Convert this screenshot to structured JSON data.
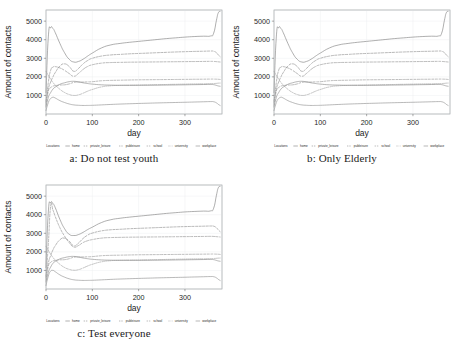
{
  "figure": {
    "panels": [
      {
        "id": "a",
        "caption": "a: Do not test youth"
      },
      {
        "id": "b",
        "caption": "b: Only Elderly"
      },
      {
        "id": "c",
        "caption": "c: Test everyone"
      }
    ]
  },
  "legend": {
    "title": "Locations",
    "entries": [
      {
        "label": "home",
        "color": "#7d7d7d",
        "dash": "none"
      },
      {
        "label": "private_leisure",
        "color": "#8a8a8a",
        "dash": "dashed"
      },
      {
        "label": "publeisure",
        "color": "#8f8f8f",
        "dash": "dashed"
      },
      {
        "label": "school",
        "color": "#949494",
        "dash": "dashed"
      },
      {
        "label": "university",
        "color": "#9a9a9a",
        "dash": "dotted"
      },
      {
        "label": "workplace",
        "color": "#878787",
        "dash": "none"
      }
    ]
  },
  "chart_data": [
    {
      "type": "line",
      "title": "a: Do not test youth",
      "xlabel": "day",
      "ylabel": "Amount of contacts",
      "xlim": [
        0,
        380
      ],
      "ylim": [
        0,
        5600
      ],
      "xticks": [
        0,
        100,
        200,
        300
      ],
      "yticks": [
        1000,
        2000,
        3000,
        4000,
        5000
      ],
      "grid": true,
      "legend_position": "bottom",
      "x": [
        0,
        5,
        10,
        15,
        20,
        30,
        40,
        50,
        60,
        70,
        80,
        90,
        100,
        120,
        140,
        160,
        180,
        200,
        220,
        240,
        260,
        280,
        300,
        320,
        340,
        355,
        362,
        368,
        372,
        376
      ],
      "series": [
        {
          "name": "home",
          "style": "solid",
          "values": [
            1150,
            4150,
            4650,
            4600,
            4380,
            3800,
            3300,
            2950,
            2800,
            2830,
            2950,
            3120,
            3280,
            3560,
            3720,
            3800,
            3860,
            3910,
            3960,
            4010,
            4060,
            4100,
            4140,
            4170,
            4190,
            4200,
            4350,
            5050,
            5450,
            5520
          ]
        },
        {
          "name": "private_leisure",
          "style": "dashed",
          "values": [
            700,
            1350,
            1720,
            2000,
            2230,
            2580,
            2700,
            2560,
            2300,
            2450,
            2700,
            2880,
            3000,
            3120,
            3180,
            3210,
            3240,
            3260,
            3280,
            3300,
            3320,
            3340,
            3355,
            3370,
            3380,
            3390,
            3380,
            3300,
            3180,
            3090
          ]
        },
        {
          "name": "publeisure",
          "style": "dashed",
          "values": [
            600,
            1700,
            2350,
            2520,
            2550,
            2480,
            2350,
            2180,
            2030,
            2180,
            2400,
            2560,
            2650,
            2740,
            2770,
            2780,
            2790,
            2795,
            2800,
            2805,
            2810,
            2815,
            2820,
            2825,
            2830,
            2835,
            2830,
            2820,
            2810,
            2800
          ]
        },
        {
          "name": "school",
          "style": "dashed",
          "values": [
            480,
            1230,
            1420,
            1500,
            1530,
            1560,
            1570,
            1620,
            1700,
            1720,
            1720,
            1730,
            1740,
            1790,
            1810,
            1820,
            1830,
            1840,
            1845,
            1850,
            1855,
            1860,
            1865,
            1870,
            1875,
            1880,
            1880,
            1875,
            1870,
            1860
          ]
        },
        {
          "name": "university",
          "style": "dotted",
          "values": [
            2300,
            2080,
            1880,
            1700,
            1560,
            1330,
            1160,
            1050,
            1000,
            1030,
            1120,
            1230,
            1320,
            1460,
            1520,
            1540,
            1550,
            1560,
            1570,
            1580,
            1590,
            1600,
            1610,
            1620,
            1625,
            1630,
            1640,
            1650,
            1660,
            1665
          ]
        },
        {
          "name": "workplace",
          "style": "solid",
          "values": [
            380,
            900,
            1150,
            1340,
            1450,
            1600,
            1680,
            1740,
            1760,
            1730,
            1680,
            1640,
            1610,
            1570,
            1555,
            1548,
            1545,
            1545,
            1548,
            1552,
            1558,
            1565,
            1572,
            1580,
            1588,
            1595,
            1580,
            1540,
            1510,
            1495
          ]
        },
        {
          "name": "low-band",
          "style": "solid",
          "values": [
            180,
            620,
            830,
            900,
            860,
            720,
            620,
            540,
            490,
            470,
            460,
            462,
            468,
            490,
            515,
            535,
            552,
            568,
            582,
            596,
            608,
            620,
            632,
            645,
            658,
            668,
            660,
            600,
            520,
            460
          ]
        }
      ]
    },
    {
      "type": "line",
      "title": "b: Only Elderly",
      "xlabel": "day",
      "ylabel": "Amount of contacts",
      "xlim": [
        0,
        380
      ],
      "ylim": [
        0,
        5600
      ],
      "xticks": [
        0,
        100,
        200,
        300
      ],
      "yticks": [
        1000,
        2000,
        3000,
        4000,
        5000
      ],
      "grid": true,
      "legend_position": "bottom",
      "x": [
        0,
        5,
        10,
        15,
        20,
        30,
        40,
        50,
        60,
        70,
        80,
        90,
        100,
        120,
        140,
        160,
        180,
        200,
        220,
        240,
        260,
        280,
        300,
        320,
        340,
        355,
        362,
        368,
        372,
        376
      ],
      "series": [
        {
          "name": "home",
          "style": "solid",
          "values": [
            1150,
            4150,
            4650,
            4600,
            4380,
            3800,
            3300,
            2950,
            2800,
            2830,
            2950,
            3120,
            3280,
            3560,
            3720,
            3800,
            3860,
            3910,
            3960,
            4010,
            4060,
            4100,
            4140,
            4170,
            4190,
            4200,
            4350,
            5050,
            5450,
            5520
          ]
        },
        {
          "name": "private_leisure",
          "style": "dashed",
          "values": [
            700,
            1350,
            1720,
            2000,
            2230,
            2580,
            2700,
            2560,
            2300,
            2450,
            2700,
            2880,
            3000,
            3120,
            3180,
            3210,
            3240,
            3260,
            3280,
            3300,
            3320,
            3340,
            3355,
            3370,
            3380,
            3390,
            3380,
            3300,
            3180,
            3090
          ]
        },
        {
          "name": "publeisure",
          "style": "dashed",
          "values": [
            600,
            1700,
            2350,
            2520,
            2550,
            2480,
            2350,
            2180,
            2030,
            2180,
            2400,
            2560,
            2650,
            2740,
            2770,
            2780,
            2790,
            2795,
            2800,
            2805,
            2810,
            2815,
            2820,
            2825,
            2830,
            2835,
            2830,
            2820,
            2810,
            2800
          ]
        },
        {
          "name": "school",
          "style": "dashed",
          "values": [
            480,
            1230,
            1420,
            1500,
            1530,
            1560,
            1570,
            1620,
            1700,
            1720,
            1720,
            1730,
            1740,
            1790,
            1810,
            1820,
            1830,
            1840,
            1845,
            1850,
            1855,
            1860,
            1865,
            1870,
            1875,
            1880,
            1880,
            1875,
            1870,
            1860
          ]
        },
        {
          "name": "university",
          "style": "dotted",
          "values": [
            2300,
            2080,
            1880,
            1700,
            1560,
            1330,
            1160,
            1050,
            1000,
            1030,
            1120,
            1230,
            1320,
            1460,
            1520,
            1540,
            1550,
            1560,
            1570,
            1580,
            1590,
            1600,
            1610,
            1620,
            1625,
            1630,
            1640,
            1650,
            1660,
            1665
          ]
        },
        {
          "name": "workplace",
          "style": "solid",
          "values": [
            380,
            900,
            1150,
            1340,
            1450,
            1600,
            1680,
            1740,
            1760,
            1730,
            1680,
            1640,
            1610,
            1570,
            1555,
            1548,
            1545,
            1545,
            1548,
            1552,
            1558,
            1565,
            1572,
            1580,
            1588,
            1595,
            1580,
            1540,
            1510,
            1495
          ]
        },
        {
          "name": "low-band",
          "style": "solid",
          "values": [
            180,
            620,
            830,
            900,
            860,
            720,
            620,
            540,
            490,
            470,
            460,
            462,
            468,
            490,
            515,
            535,
            552,
            568,
            582,
            596,
            608,
            620,
            632,
            645,
            658,
            668,
            660,
            600,
            520,
            460
          ]
        }
      ]
    },
    {
      "type": "line",
      "title": "c: Test everyone",
      "xlabel": "day",
      "ylabel": "Amount of contacts",
      "xlim": [
        0,
        380
      ],
      "ylim": [
        0,
        5600
      ],
      "xticks": [
        0,
        100,
        200,
        300
      ],
      "yticks": [
        1000,
        2000,
        3000,
        4000,
        5000
      ],
      "grid": true,
      "legend_position": "bottom",
      "x": [
        0,
        5,
        10,
        15,
        20,
        30,
        40,
        50,
        60,
        70,
        80,
        90,
        100,
        120,
        140,
        160,
        180,
        200,
        220,
        240,
        260,
        280,
        300,
        320,
        340,
        355,
        362,
        368,
        372,
        376
      ],
      "series": [
        {
          "name": "home",
          "style": "solid",
          "values": [
            1150,
            4150,
            4650,
            4600,
            4380,
            3750,
            3250,
            2950,
            2880,
            2930,
            3050,
            3200,
            3330,
            3580,
            3730,
            3810,
            3870,
            3920,
            3970,
            4020,
            4070,
            4110,
            4150,
            4175,
            4195,
            4205,
            4350,
            5050,
            5450,
            5520
          ]
        },
        {
          "name": "private_leisure",
          "style": "dashed",
          "values": [
            700,
            1400,
            1800,
            2100,
            2330,
            2650,
            2740,
            2580,
            2320,
            2470,
            2720,
            2900,
            3010,
            3130,
            3190,
            3215,
            3245,
            3265,
            3285,
            3305,
            3325,
            3345,
            3360,
            3372,
            3382,
            3392,
            3382,
            3300,
            3180,
            3090
          ]
        },
        {
          "name": "publeisure",
          "style": "dashed",
          "values": [
            600,
            2400,
            4450,
            4250,
            3900,
            3300,
            2850,
            2500,
            2260,
            2340,
            2500,
            2600,
            2660,
            2740,
            2770,
            2780,
            2790,
            2795,
            2800,
            2805,
            2810,
            2815,
            2820,
            2825,
            2830,
            2835,
            2830,
            2820,
            2810,
            2800
          ]
        },
        {
          "name": "school",
          "style": "dashed",
          "values": [
            480,
            1230,
            1430,
            1510,
            1540,
            1570,
            1580,
            1630,
            1710,
            1725,
            1725,
            1735,
            1745,
            1792,
            1812,
            1822,
            1832,
            1842,
            1847,
            1852,
            1857,
            1862,
            1867,
            1872,
            1877,
            1882,
            1882,
            1877,
            1872,
            1862
          ]
        },
        {
          "name": "university",
          "style": "dotted",
          "values": [
            2300,
            2080,
            1880,
            1700,
            1560,
            1330,
            1160,
            1060,
            1010,
            1040,
            1130,
            1240,
            1330,
            1465,
            1525,
            1545,
            1555,
            1562,
            1572,
            1582,
            1592,
            1602,
            1612,
            1622,
            1627,
            1632,
            1642,
            1652,
            1662,
            1667
          ]
        },
        {
          "name": "workplace",
          "style": "solid",
          "values": [
            380,
            900,
            1180,
            1380,
            1490,
            1620,
            1690,
            1740,
            1755,
            1720,
            1670,
            1630,
            1600,
            1565,
            1552,
            1546,
            1544,
            1544,
            1547,
            1551,
            1557,
            1564,
            1571,
            1579,
            1587,
            1594,
            1580,
            1540,
            1510,
            1495
          ]
        },
        {
          "name": "low-band",
          "style": "solid",
          "values": [
            180,
            700,
            960,
            1000,
            930,
            760,
            640,
            550,
            495,
            472,
            462,
            464,
            470,
            492,
            517,
            537,
            554,
            570,
            584,
            598,
            610,
            622,
            634,
            647,
            660,
            670,
            662,
            600,
            520,
            460
          ]
        }
      ]
    }
  ]
}
